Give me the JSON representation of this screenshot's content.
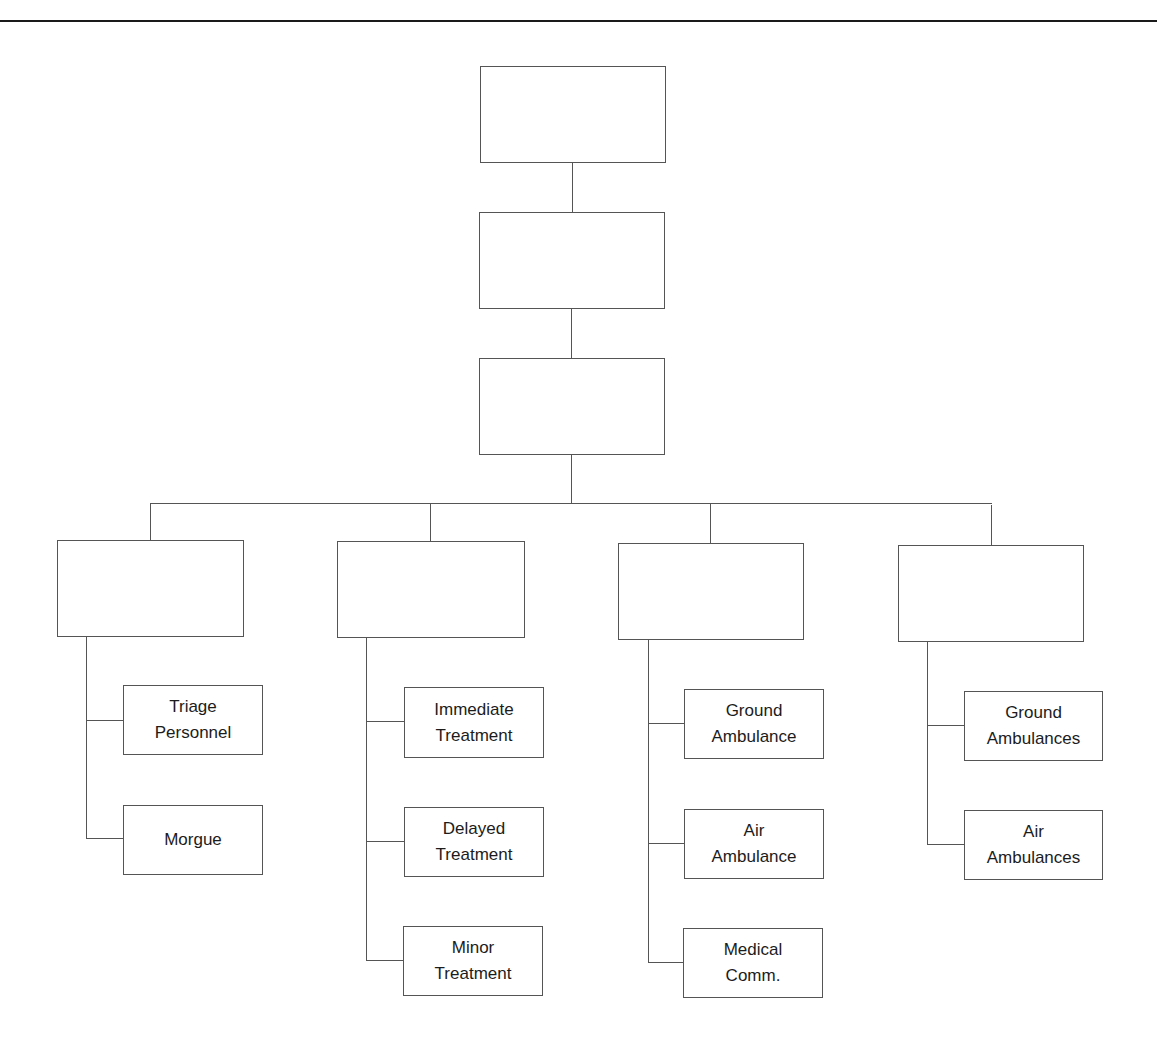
{
  "header": {
    "running_head": "",
    "note": "header text clipped at page top; not legible"
  },
  "chart": {
    "type": "org-chart",
    "levels": [
      {
        "id": "level-1",
        "label": ""
      },
      {
        "id": "level-2",
        "label": ""
      },
      {
        "id": "level-3",
        "label": ""
      }
    ],
    "branches": [
      {
        "label": "",
        "children": [
          "Triage\nPersonnel",
          "Morgue"
        ]
      },
      {
        "label": "",
        "children": [
          "Immediate\nTreatment",
          "Delayed\nTreatment",
          "Minor\nTreatment"
        ]
      },
      {
        "label": "",
        "children": [
          "Ground\nAmbulance",
          "Air\nAmbulance",
          "Medical\nComm."
        ]
      },
      {
        "label": "",
        "children": [
          "Ground\nAmbulances",
          "Air\nAmbulances"
        ]
      }
    ]
  },
  "colors": {
    "line": "#555555",
    "text": "#1c1c1c",
    "rule": "#1a1a1a"
  }
}
